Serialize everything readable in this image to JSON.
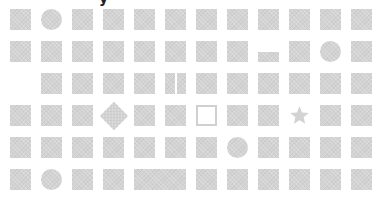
{
  "header": {
    "partial_glyph": "y"
  },
  "grid": {
    "columns": 12,
    "rows": 6,
    "origin": {
      "x": 10,
      "y": 9
    },
    "pitch": {
      "x": 31,
      "y": 32
    },
    "cell_size": 21,
    "fill_color": "#d3d3d3",
    "outline_color": "#d0d0d0",
    "cells": [
      [
        "square",
        "circle",
        "square",
        "square",
        "square",
        "square",
        "square",
        "square",
        "square",
        "square",
        "square",
        "square"
      ],
      [
        "square",
        "square",
        "square",
        "square",
        "square",
        "square",
        "square",
        "square",
        "bar",
        "square",
        "circle",
        "square"
      ],
      [
        "empty",
        "square",
        "square",
        "square",
        "square",
        "split",
        "square",
        "square",
        "square",
        "square",
        "square",
        "square"
      ],
      [
        "square",
        "square",
        "square",
        "diamond",
        "square",
        "square",
        "outline",
        "square",
        "square",
        "star",
        "square",
        "square"
      ],
      [
        "square",
        "square",
        "square",
        "square",
        "square",
        "square",
        "square",
        "circle",
        "square",
        "square",
        "square",
        "square"
      ],
      [
        "square",
        "circle",
        "square",
        "square",
        "wide",
        "merged",
        "square",
        "square",
        "square",
        "square",
        "square",
        "square"
      ]
    ]
  }
}
